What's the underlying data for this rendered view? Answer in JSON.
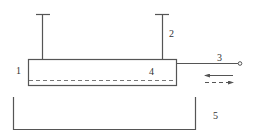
{
  "diagram": {
    "labels": {
      "l1": "1",
      "l2": "2",
      "l3": "3",
      "l4": "4",
      "l5": "5"
    },
    "parts": [
      {
        "id": "1",
        "name": "plate body (rectangle)"
      },
      {
        "id": "2",
        "name": "vertical support rods with T-caps"
      },
      {
        "id": "3",
        "name": "horizontal rod with terminal"
      },
      {
        "id": "4",
        "name": "inner layer (dashed line)"
      },
      {
        "id": "5",
        "name": "open tank / bath"
      }
    ],
    "arrows": [
      {
        "style": "solid",
        "direction": "left"
      },
      {
        "style": "dashed",
        "direction": "right"
      }
    ],
    "colors": {
      "stroke": "#555555",
      "background": "#ffffff"
    }
  }
}
